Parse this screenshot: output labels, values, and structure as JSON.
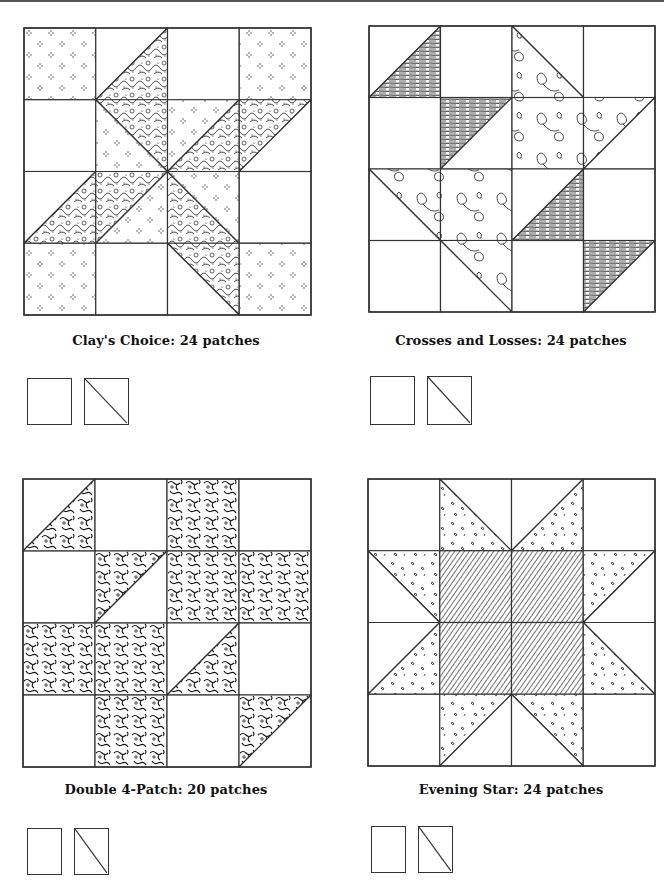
{
  "page": {
    "blocks": [
      {
        "id": "clays-choice",
        "caption": "Clay's Choice: 24 patches",
        "pos": {
          "x": 23,
          "y": 27,
          "size": 287
        },
        "patch_types": [
          "square",
          "half-square-triangle"
        ],
        "cells": [
          [
            "D",
            "TL:W|BR:F",
            "P",
            "D"
          ],
          [
            "P",
            "TR:F|BL:D",
            "TL:D|BR:F",
            "TL:F|BR:P"
          ],
          [
            "TL:P|BR:F",
            "TL:F|BR:D",
            "BL:F|TR:D",
            "P"
          ],
          [
            "D",
            "P",
            "TR:F|BL:P",
            "D"
          ]
        ]
      },
      {
        "id": "crosses-and-losses",
        "caption": "Crosses and Losses: 24 patches",
        "pos": {
          "x": 368,
          "y": 25,
          "size": 286
        },
        "patch_types": [
          "square",
          "half-square-triangle"
        ],
        "cells": [
          [
            "TL:P|BR:S",
            "P",
            "TR:P|BL:L",
            "P"
          ],
          [
            "P",
            "TL:S|BR:P",
            "L",
            "TL:L|BR:P"
          ],
          [
            "TR:L|BL:P",
            "L",
            "TL:P|BR:S",
            "P"
          ],
          [
            "P",
            "TR:L|BL:P",
            "P",
            "TL:S|BR:P"
          ]
        ]
      },
      {
        "id": "double-4-patch",
        "caption": "Double 4-Patch: 20 patches",
        "pos": {
          "x": 22,
          "y": 478,
          "size": 288
        },
        "patch_types": [
          "square",
          "half-square-triangle"
        ],
        "cells": [
          [
            "TL:P|BR:V",
            "P",
            "V",
            "P"
          ],
          [
            "P",
            "TL:V|BR:P",
            "V",
            "V"
          ],
          [
            "V",
            "V",
            "TL:P|BR:V",
            "P"
          ],
          [
            "P",
            "V",
            "P",
            "TL:V|BR:P"
          ]
        ]
      },
      {
        "id": "evening-star",
        "caption": "Evening Star: 24 patches",
        "pos": {
          "x": 367,
          "y": 478,
          "size": 287
        },
        "patch_types": [
          "square",
          "half-square-triangle"
        ],
        "cells": [
          [
            "P",
            "TR:P|BL:R",
            "TL:P|BR:R",
            "P"
          ],
          [
            "TR:R|BL:P",
            "H",
            "H",
            "TL:R|BR:P"
          ],
          [
            "TL:P|BR:R",
            "H",
            "H",
            "TR:P|BL:R"
          ],
          [
            "P",
            "TL:R|BR:P",
            "TR:R|BL:P",
            "P"
          ]
        ]
      }
    ],
    "captions_pos": [
      {
        "x": 166,
        "y": 333
      },
      {
        "x": 511,
        "y": 333
      },
      {
        "x": 166,
        "y": 782
      },
      {
        "x": 511,
        "y": 782
      }
    ],
    "patch_icons_pos": [
      {
        "x": 27,
        "y": 378,
        "w": 45,
        "h": 47
      },
      {
        "x": 370,
        "y": 376,
        "w": 45,
        "h": 49
      },
      {
        "x": 27,
        "y": 828,
        "w": 35,
        "h": 47
      },
      {
        "x": 371,
        "y": 826,
        "w": 35,
        "h": 47
      }
    ],
    "fills": {
      "P": {
        "name": "plain",
        "color": "#ffffff"
      },
      "W": {
        "name": "plain",
        "color": "#ffffff"
      },
      "D": {
        "name": "dotted-diamond-print"
      },
      "F": {
        "name": "dense-floral-print"
      },
      "S": {
        "name": "striped-woodgrain"
      },
      "L": {
        "name": "large-floral-outline"
      },
      "V": {
        "name": "vine-scroll-print"
      },
      "R": {
        "name": "sprig-print"
      },
      "H": {
        "name": "diagonal-hatch"
      }
    },
    "line_color": "#333333"
  }
}
